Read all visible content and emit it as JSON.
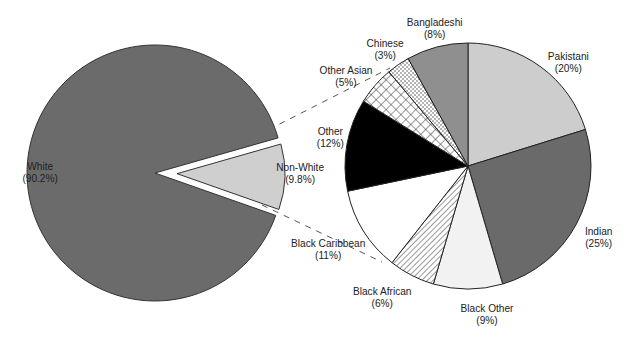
{
  "chart_data": {
    "type": "pie",
    "title": "",
    "charts": [
      {
        "name": "main-pie",
        "slices": [
          {
            "label": "White",
            "value_label": "(90.2%)",
            "value": 90.2,
            "fill": "#6b6b6b",
            "pattern": "solid"
          },
          {
            "label": "Non-White",
            "value_label": "(9.8%)",
            "value": 9.8,
            "fill": "#cfcfcf",
            "pattern": "solid",
            "exploded": true
          }
        ]
      },
      {
        "name": "breakdown-pie",
        "subtitle": "Breakdown of Non-White",
        "slices": [
          {
            "label": "Pakistani",
            "value_label": "(20%)",
            "value": 20,
            "fill": "#cdcdcd",
            "pattern": "solid"
          },
          {
            "label": "Indian",
            "value_label": "(25%)",
            "value": 25,
            "fill": "#6a6a6a",
            "pattern": "solid"
          },
          {
            "label": "Black Other",
            "value_label": "(9%)",
            "value": 9,
            "fill": "#f2f2f2",
            "pattern": "solid"
          },
          {
            "label": "Black African",
            "value_label": "(6%)",
            "value": 6,
            "fill": "#ffffff",
            "pattern": "diagonal-lines"
          },
          {
            "label": "Black Caribbean",
            "value_label": "(11%)",
            "value": 11,
            "fill": "#ffffff",
            "pattern": "solid"
          },
          {
            "label": "Other",
            "value_label": "(12%)",
            "value": 12,
            "fill": "#000000",
            "pattern": "solid"
          },
          {
            "label": "Other Asian",
            "value_label": "(5%)",
            "value": 5,
            "fill": "#ffffff",
            "pattern": "crosshatch"
          },
          {
            "label": "Chinese",
            "value_label": "(3%)",
            "value": 3,
            "fill": "#ffffff",
            "pattern": "dots"
          },
          {
            "label": "Bangladeshi",
            "value_label": "(8%)",
            "value": 8,
            "fill": "#8f8f8f",
            "pattern": "solid"
          }
        ]
      }
    ],
    "legend": "none (direct labels)",
    "connector": "dashed lines from Non-White slice to breakdown pie"
  },
  "labels": {
    "white": {
      "name": "White",
      "pct": "(90.2%)"
    },
    "nonwhite": {
      "name": "Non-White",
      "pct": "(9.8%)"
    },
    "pakistani": {
      "name": "Pakistani",
      "pct": "(20%)"
    },
    "indian": {
      "name": "Indian",
      "pct": "(25%)"
    },
    "black_other": {
      "name": "Black Other",
      "pct": "(9%)"
    },
    "black_african": {
      "name": "Black African",
      "pct": "(6%)"
    },
    "black_caribbean": {
      "name": "Black Caribbean",
      "pct": "(11%)"
    },
    "other": {
      "name": "Other",
      "pct": "(12%)"
    },
    "other_asian": {
      "name": "Other Asian",
      "pct": "(5%)"
    },
    "chinese": {
      "name": "Chinese",
      "pct": "(3%)"
    },
    "bangladeshi": {
      "name": "Bangladeshi",
      "pct": "(8%)"
    }
  }
}
